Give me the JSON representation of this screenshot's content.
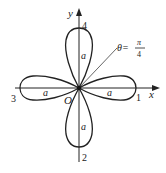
{
  "diagram": {
    "type": "polar-rose",
    "axes": {
      "x_label": "x",
      "y_label": "y",
      "origin_label": "O"
    },
    "petals": [
      {
        "id": "1",
        "direction": "right",
        "length_label": "a"
      },
      {
        "id": "2",
        "direction": "down",
        "length_label": "a"
      },
      {
        "id": "3",
        "direction": "left",
        "length_label": "a"
      },
      {
        "id": "4",
        "direction": "up",
        "length_label": "a"
      }
    ],
    "ray": {
      "label_lhs": "θ=",
      "numerator": "π",
      "denominator": "4"
    },
    "colors": {
      "stroke": "#222222",
      "background": "#ffffff"
    }
  }
}
